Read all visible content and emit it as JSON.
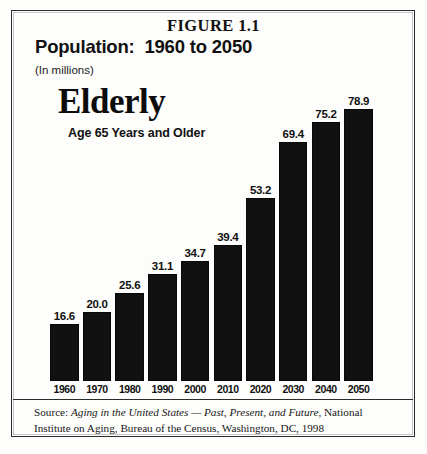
{
  "figure": {
    "caption": "FIGURE 1.1",
    "title": "Population:  1960 to 2050",
    "units": "(In millions)",
    "series_name": "Elderly",
    "series_subtitle": "Age 65 Years and Older",
    "border_color": "#2b2b2b",
    "bar_color": "#111111",
    "background_color": "#fdfdfb"
  },
  "source": {
    "prefix": "Source: ",
    "publication": "Aging in the United States — Past, Present, and Future",
    "suffix": ", National Institute on Aging, Bureau of the Census, Washington, DC, 1998"
  },
  "chart_data": {
    "type": "bar",
    "title": "Population:  1960 to 2050",
    "subtitle": "Elderly — Age 65 Years and Older",
    "xlabel": "",
    "ylabel": "(In millions)",
    "ylim": [
      0,
      85
    ],
    "grid": false,
    "legend": false,
    "categories": [
      "1960",
      "1970",
      "1980",
      "1990",
      "2000",
      "2010",
      "2020",
      "2030",
      "2040",
      "2050"
    ],
    "values": [
      16.6,
      20.0,
      25.6,
      31.1,
      34.7,
      39.4,
      53.2,
      69.4,
      75.2,
      78.9
    ],
    "value_labels": [
      "16.6",
      "20.0",
      "25.6",
      "31.1",
      "34.7",
      "39.4",
      "53.2",
      "69.4",
      "75.2",
      "78.9"
    ]
  }
}
